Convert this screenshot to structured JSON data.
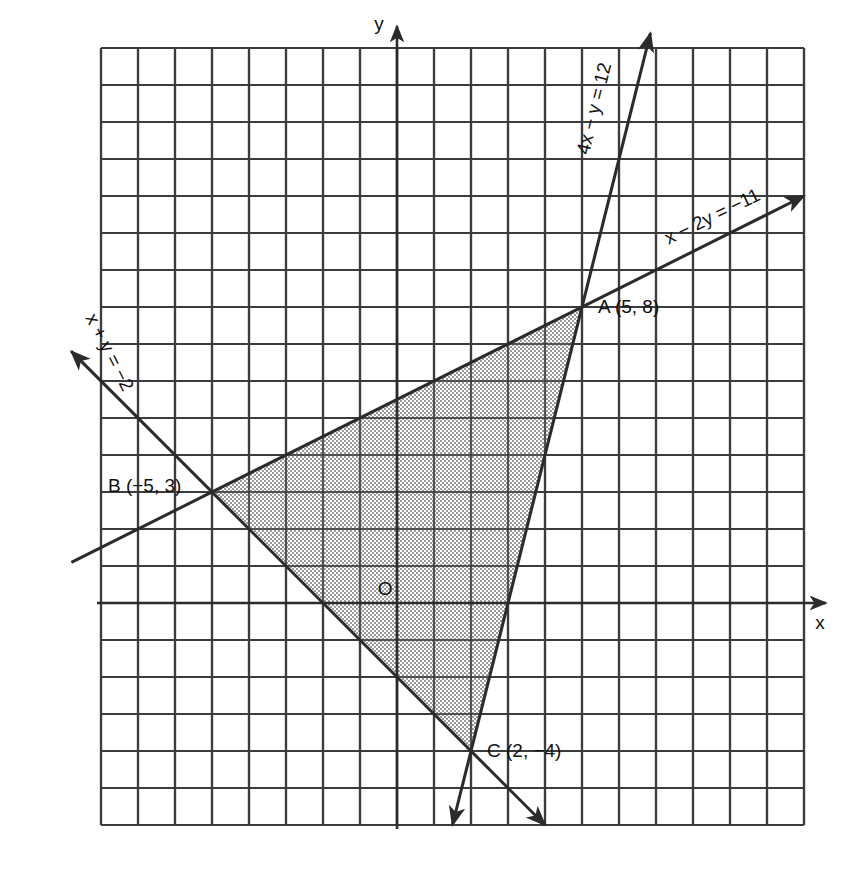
{
  "figure": {
    "type": "coordinate-graph",
    "background_color": "#ffffff",
    "ink_color": "#2b2b2b",
    "shade_color": "#b9b9b9"
  },
  "axes": {
    "x_label": "x",
    "y_label": "y",
    "origin_label": "O",
    "origin_px": [
      397,
      603
    ],
    "unit_px": 37,
    "x_range": [
      -8.8,
      11.0
    ],
    "y_range": [
      -6.0,
      15.4
    ],
    "grid": true,
    "grid_color": "#3c3c3c"
  },
  "lines": [
    {
      "id": "line-4x-y-12",
      "label": "4x − y = 12",
      "equation": "4x - y = 12",
      "a": 4,
      "b": -1,
      "c": 12,
      "label_pos": [
        600,
        110
      ],
      "label_rotation": -76,
      "arrow_start": true,
      "arrow_end": true
    },
    {
      "id": "line-x-2y-neg11",
      "label": "x − 2y = −11",
      "equation": "x - 2y = -11",
      "a": 1,
      "b": -2,
      "c": -11,
      "label_pos": [
        715,
        222
      ],
      "label_rotation": -26,
      "arrow_start": false,
      "arrow_end": true
    },
    {
      "id": "line-x-y-neg2",
      "label": "x + y = −2",
      "equation": "x + y = -2",
      "a": 1,
      "b": 1,
      "c": -2,
      "label_pos": [
        104,
        355
      ],
      "label_rotation": 63,
      "arrow_start": true,
      "arrow_end": true
    }
  ],
  "vertices": [
    {
      "name": "A",
      "label": "A (5, 8)",
      "x": 5,
      "y": 8,
      "label_px": [
        598,
        313
      ]
    },
    {
      "name": "B",
      "label": "B (−5, 3)",
      "x": -5,
      "y": 3,
      "label_px": [
        108,
        492
      ]
    },
    {
      "name": "C",
      "label": "C (2, −4)",
      "x": 2,
      "y": -4,
      "label_px": [
        487,
        757
      ]
    }
  ],
  "region": {
    "name": "triangle-ABC",
    "shaded": true,
    "vertices": [
      "A",
      "B",
      "C"
    ]
  },
  "chart_data": {
    "type": "line",
    "title": "",
    "xlabel": "x",
    "ylabel": "y",
    "xlim": [
      -8.8,
      11.0
    ],
    "ylim": [
      -6.0,
      15.4
    ],
    "grid": true,
    "legend": "inline-labels",
    "series": [
      {
        "name": "4x − y = 12",
        "x": [
          -0.2,
          7.0
        ],
        "y": [
          -12.8,
          16.0
        ]
      },
      {
        "name": "x − 2y = −11",
        "x": [
          -8.8,
          11.0
        ],
        "y": [
          1.1,
          11.0
        ]
      },
      {
        "name": "x + y = −2",
        "x": [
          -8.8,
          6.0
        ],
        "y": [
          6.8,
          -8.0
        ]
      }
    ],
    "annotations": [
      {
        "text": "A (5, 8)",
        "x": 5,
        "y": 8
      },
      {
        "text": "B (−5, 3)",
        "x": -5,
        "y": 3
      },
      {
        "text": "C (2, −4)",
        "x": 2,
        "y": -4
      },
      {
        "text": "O",
        "x": -0.25,
        "y": 0.38
      }
    ]
  }
}
